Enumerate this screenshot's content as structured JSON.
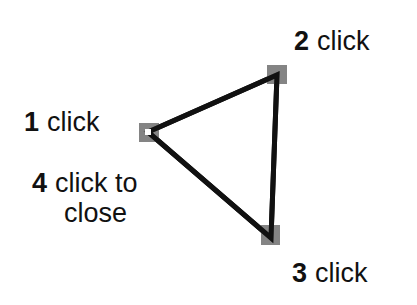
{
  "diagram": {
    "steps": [
      {
        "number": "1",
        "text": "click"
      },
      {
        "number": "2",
        "text": "click"
      },
      {
        "number": "3",
        "text": "click"
      },
      {
        "number": "4",
        "text": "click to",
        "text2": "close"
      }
    ],
    "vertices": [
      {
        "id": 1,
        "x": 148,
        "y": 132
      },
      {
        "id": 2,
        "x": 277,
        "y": 75
      },
      {
        "id": 3,
        "x": 271,
        "y": 238
      }
    ],
    "colors": {
      "stroke": "#111111",
      "handle": "#6e6e6e",
      "point": "#ffffff"
    }
  }
}
